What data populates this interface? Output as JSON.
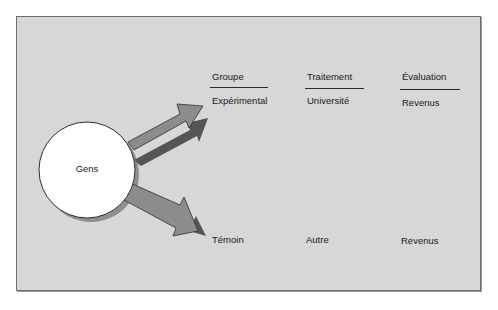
{
  "diagram": {
    "source_node": {
      "label": "Gens"
    },
    "columns": [
      {
        "header": "Groupe",
        "row1": "Expérimental",
        "row2": "Témoin"
      },
      {
        "header": "Traitement",
        "row1": "Université",
        "row2": "Autre"
      },
      {
        "header": "Évaluation",
        "row1": "Revenus",
        "row2": "Revenus"
      }
    ],
    "colors": {
      "panel_background": "#d7d7d7",
      "panel_border": "#6e6e6e",
      "arrow_fill": "#8c8c8c",
      "arrow_shadow": "#555555",
      "circle_fill": "#ffffff",
      "text": "#1a1a1a"
    }
  }
}
